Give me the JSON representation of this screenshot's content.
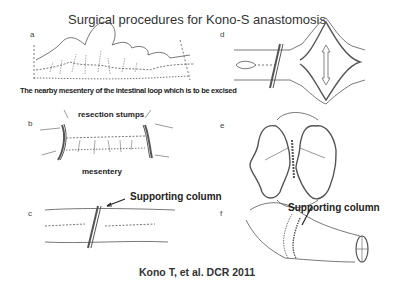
{
  "title": "Surgical procedures for Kono-S anastomosis",
  "panels": {
    "a": {
      "letter": "a",
      "caption": "The nearby mesentery of the intestinal loop which is to be excised"
    },
    "b": {
      "letter": "b",
      "label_top": "resection stumps",
      "label_bottom": "mesentery"
    },
    "c": {
      "letter": "c",
      "label": "Supporting column"
    },
    "d": {
      "letter": "d"
    },
    "e": {
      "letter": "e"
    },
    "f": {
      "letter": "f",
      "label": "Supporting column"
    }
  },
  "citation": "Kono T, et al. DCR 2011",
  "colors": {
    "ink": "#333333",
    "background": "#ffffff"
  }
}
